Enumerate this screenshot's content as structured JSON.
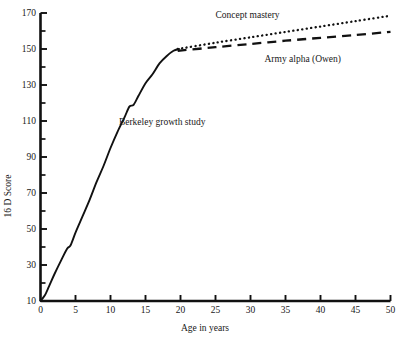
{
  "chart_data": {
    "type": "line",
    "title": "",
    "xlabel": "Age in years",
    "ylabel": "16 D Score",
    "xlim": [
      0,
      50
    ],
    "ylim": [
      10,
      170
    ],
    "grid": false,
    "legend_position": "inline-annotations",
    "x_ticks": [
      0,
      5,
      10,
      15,
      20,
      25,
      30,
      35,
      40,
      45,
      50
    ],
    "x_tick_labels": [
      "0",
      "5",
      "10",
      "15",
      "20",
      "25",
      "30",
      "35",
      "40",
      "45",
      "50"
    ],
    "y_ticks": [
      10,
      30,
      50,
      70,
      90,
      110,
      130,
      150,
      170
    ],
    "y_tick_labels": [
      "10",
      "30",
      "50",
      "70",
      "90",
      "110",
      "130",
      "150",
      "170"
    ],
    "y_minor_ticks": [
      20,
      40,
      60,
      80,
      100,
      120,
      140,
      160
    ],
    "series": [
      {
        "name": "Berkeley growth study",
        "style": "solid",
        "color": "#111111",
        "label_x": 11.2,
        "label_y": 108,
        "points": [
          [
            0.0,
            10.0
          ],
          [
            0.6,
            13.0
          ],
          [
            1.2,
            18.0
          ],
          [
            2.0,
            25.0
          ],
          [
            3.0,
            33.0
          ],
          [
            3.8,
            39.0
          ],
          [
            4.3,
            41.0
          ],
          [
            5.0,
            48.0
          ],
          [
            6.0,
            57.0
          ],
          [
            7.0,
            66.0
          ],
          [
            8.0,
            76.0
          ],
          [
            9.0,
            85.0
          ],
          [
            10.0,
            95.0
          ],
          [
            11.0,
            104.0
          ],
          [
            12.0,
            112.0
          ],
          [
            12.7,
            118.0
          ],
          [
            13.3,
            119.0
          ],
          [
            14.0,
            124.0
          ],
          [
            15.0,
            131.0
          ],
          [
            16.0,
            136.0
          ],
          [
            17.0,
            142.0
          ],
          [
            18.0,
            146.0
          ],
          [
            19.0,
            149.0
          ],
          [
            19.8,
            150.0
          ]
        ]
      },
      {
        "name": "Concept mastery",
        "style": "dotted",
        "color": "#111111",
        "label_x": 25.0,
        "label_y": 167,
        "points": [
          [
            19.6,
            150.0
          ],
          [
            25.0,
            153.5
          ],
          [
            30.0,
            156.5
          ],
          [
            35.0,
            159.5
          ],
          [
            40.0,
            162.5
          ],
          [
            45.0,
            165.5
          ],
          [
            50.0,
            168.5
          ]
        ]
      },
      {
        "name": "Army alpha (Owen)",
        "style": "dashed",
        "color": "#111111",
        "label_x": 32.0,
        "label_y": 143,
        "points": [
          [
            19.6,
            149.0
          ],
          [
            25.0,
            151.0
          ],
          [
            30.0,
            152.8
          ],
          [
            35.0,
            154.6
          ],
          [
            40.0,
            156.2
          ],
          [
            45.0,
            157.8
          ],
          [
            50.0,
            159.5
          ]
        ]
      }
    ]
  },
  "axes": {
    "y_axis_title": "16 D Score",
    "x_axis_title": "Age in years"
  },
  "annotations": {
    "berkeley": "Berkeley growth study",
    "concept": "Concept mastery",
    "army": "Army alpha (Owen)"
  }
}
